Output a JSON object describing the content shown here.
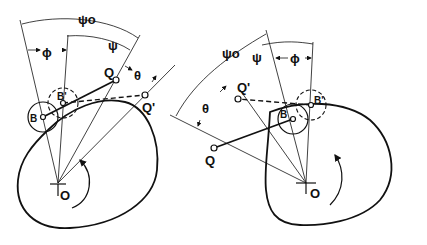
{
  "figure": {
    "left_diagram": {
      "labels": {
        "psi0": "ψo",
        "psi": "ψ",
        "phi": "ϕ",
        "theta": "θ",
        "Q": "Q",
        "Q_prime": "Q'",
        "B": "B",
        "B_prime": "B'",
        "O": "O"
      },
      "rotation": "counterclockwise"
    },
    "right_diagram": {
      "labels": {
        "psi0": "ψo",
        "psi": "ψ",
        "phi": "ϕ",
        "theta": "θ",
        "Q": "Q",
        "Q_prime": "Q'",
        "B": "B",
        "B_prime": "B'",
        "O": "O"
      },
      "rotation": "clockwise"
    }
  }
}
